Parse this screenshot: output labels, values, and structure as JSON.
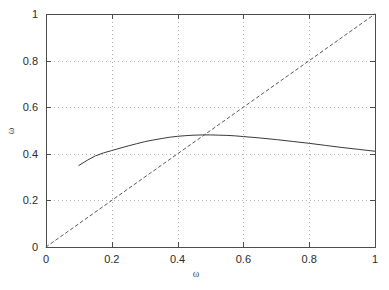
{
  "chart_data": {
    "type": "line",
    "title": "",
    "subtitle": "",
    "xlabel": "ω",
    "ylabel": "ω",
    "xlim": [
      0,
      1
    ],
    "ylim": [
      0,
      1
    ],
    "grid": true,
    "legend": "none",
    "background": "#ffffff",
    "border_color": "#4d4d4d",
    "grid_color": "#b3b3b3",
    "xticks": [
      0,
      0.2,
      0.4,
      0.6,
      0.8,
      1
    ],
    "xticklabels": [
      "0",
      "0.2",
      "0.4",
      "0.6",
      "0.8",
      "1"
    ],
    "yticks": [
      0,
      0.2,
      0.4,
      0.6,
      0.8,
      1
    ],
    "yticklabels": [
      "0",
      "0.2",
      "0.4",
      "0.6",
      "0.8",
      "1"
    ],
    "series": [
      {
        "name": "response-curve",
        "style": "solid",
        "color": "#3a3a3a",
        "x": [
          0.1,
          0.125,
          0.15,
          0.175,
          0.2,
          0.225,
          0.25,
          0.275,
          0.3,
          0.325,
          0.35,
          0.375,
          0.4,
          0.425,
          0.45,
          0.475,
          0.5,
          0.525,
          0.55,
          0.575,
          0.6,
          0.65,
          0.7,
          0.75,
          0.8,
          0.85,
          0.9,
          0.95,
          1.0
        ],
        "y": [
          0.35,
          0.372,
          0.391,
          0.404,
          0.414,
          0.424,
          0.434,
          0.443,
          0.452,
          0.459,
          0.465,
          0.471,
          0.475,
          0.478,
          0.48,
          0.481,
          0.481,
          0.48,
          0.479,
          0.477,
          0.474,
          0.468,
          0.461,
          0.453,
          0.445,
          0.436,
          0.427,
          0.419,
          0.411
        ]
      },
      {
        "name": "identity-line",
        "style": "dashed",
        "color": "#5a5a5a",
        "x": [
          0,
          1
        ],
        "y": [
          0,
          1
        ]
      }
    ]
  },
  "figure": {
    "name": "omega-fixed-point-plot"
  }
}
